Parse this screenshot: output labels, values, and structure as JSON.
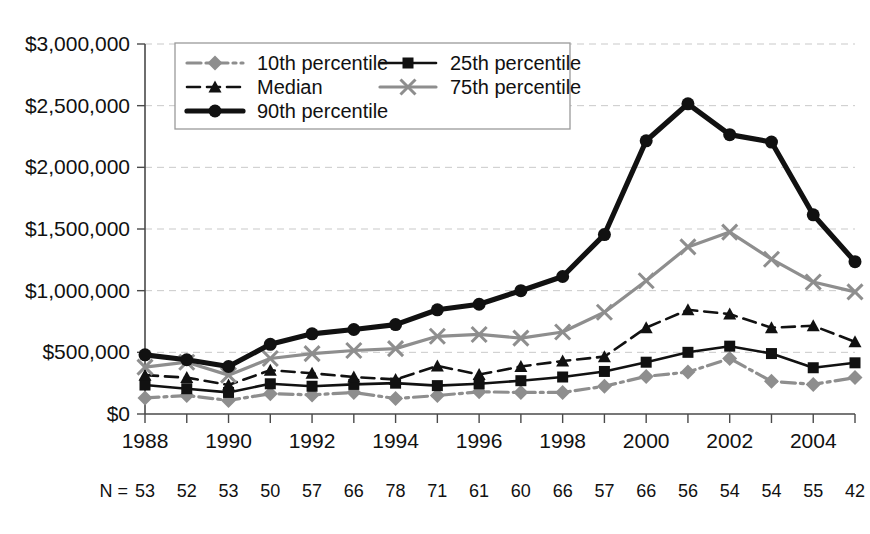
{
  "chart_data": {
    "type": "line",
    "title": "",
    "subtitle": "",
    "xlabel": "",
    "ylabel": "",
    "grid": true,
    "legend_position": "top-left-inside",
    "x": [
      1988,
      1989,
      1990,
      1991,
      1992,
      1993,
      1994,
      1995,
      1996,
      1997,
      1998,
      1999,
      2000,
      2001,
      2002,
      2003,
      2004,
      2005
    ],
    "xtick_labels": [
      "1988",
      "1990",
      "1992",
      "1994",
      "1996",
      "1998",
      "2000",
      "2002",
      "2004"
    ],
    "xtick_values": [
      1988,
      1990,
      1992,
      1994,
      1996,
      1998,
      2000,
      2002,
      2004
    ],
    "xlim": [
      1988,
      2005
    ],
    "ylim": [
      0,
      3000000
    ],
    "ytick_labels": [
      "$0",
      "$500,000",
      "$1,000,000",
      "$1,500,000",
      "$2,000,000",
      "$2,500,000",
      "$3,000,000"
    ],
    "ytick_values": [
      0,
      500000,
      1000000,
      1500000,
      2000000,
      2500000,
      3000000
    ],
    "series": [
      {
        "name": "10th percentile",
        "color": "#8e8e8e",
        "marker": "diamond",
        "dash": "dashdot",
        "values": [
          130000,
          150000,
          110000,
          165000,
          155000,
          175000,
          125000,
          150000,
          180000,
          175000,
          175000,
          225000,
          305000,
          340000,
          450000,
          265000,
          240000,
          295000
        ]
      },
      {
        "name": "25th percentile",
        "color": "#111111",
        "marker": "square",
        "dash": "solid",
        "values": [
          235000,
          205000,
          175000,
          245000,
          225000,
          240000,
          250000,
          230000,
          245000,
          270000,
          300000,
          345000,
          420000,
          500000,
          550000,
          490000,
          375000,
          415000
        ]
      },
      {
        "name": "Median",
        "color": "#111111",
        "marker": "triangle",
        "dash": "dashed",
        "values": [
          315000,
          295000,
          235000,
          355000,
          330000,
          300000,
          280000,
          390000,
          320000,
          385000,
          430000,
          465000,
          700000,
          845000,
          810000,
          700000,
          715000,
          585000
        ]
      },
      {
        "name": "75th percentile",
        "color": "#8e8e8e",
        "marker": "x",
        "dash": "solid",
        "values": [
          380000,
          420000,
          315000,
          450000,
          490000,
          515000,
          530000,
          630000,
          645000,
          615000,
          665000,
          825000,
          1080000,
          1355000,
          1475000,
          1255000,
          1070000,
          990000
        ]
      },
      {
        "name": "90th percentile",
        "color": "#111111",
        "marker": "circle",
        "dash": "solid",
        "values": [
          480000,
          440000,
          385000,
          565000,
          650000,
          685000,
          725000,
          845000,
          890000,
          1000000,
          1115000,
          1455000,
          2215000,
          2515000,
          2265000,
          2205000,
          1615000,
          1235000
        ]
      }
    ],
    "annotations": {
      "n_label": "N =",
      "n_values": [
        "53",
        "52",
        "53",
        "50",
        "57",
        "66",
        "78",
        "71",
        "61",
        "60",
        "66",
        "57",
        "66",
        "56",
        "54",
        "54",
        "55",
        "42"
      ]
    }
  },
  "legend": {
    "entries": [
      {
        "label": "10th percentile"
      },
      {
        "label": "25th percentile"
      },
      {
        "label": "Median"
      },
      {
        "label": "75th percentile"
      },
      {
        "label": "90th percentile"
      }
    ]
  },
  "colors": {
    "gray_series": "#8e8e8e",
    "dark_series": "#111111",
    "gridline": "#c9c9c9",
    "axis": "#4a4a4a",
    "background": "#ffffff"
  }
}
